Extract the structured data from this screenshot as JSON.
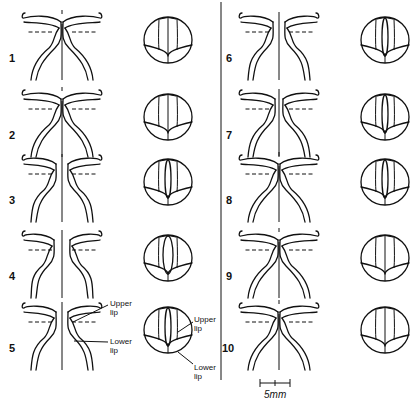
{
  "figure": {
    "panels": [
      {
        "number": "1",
        "column": "left",
        "stage": "closed",
        "eye_lens": "narrow-open"
      },
      {
        "number": "2",
        "column": "left",
        "stage": "closed",
        "eye_lens": "narrow-open"
      },
      {
        "number": "3",
        "column": "left",
        "stage": "open",
        "eye_lens": "slit"
      },
      {
        "number": "4",
        "column": "left",
        "stage": "wide-open",
        "eye_lens": "oval"
      },
      {
        "number": "5",
        "column": "left",
        "stage": "open",
        "eye_lens": "slit-dark"
      },
      {
        "number": "6",
        "column": "right",
        "stage": "open",
        "eye_lens": "slit"
      },
      {
        "number": "7",
        "column": "right",
        "stage": "partially-open",
        "eye_lens": "slit"
      },
      {
        "number": "8",
        "column": "right",
        "stage": "nearly-closed",
        "eye_lens": "slit"
      },
      {
        "number": "9",
        "column": "right",
        "stage": "closed",
        "eye_lens": "narrow-open"
      },
      {
        "number": "10",
        "column": "right",
        "stage": "closed",
        "eye_lens": "narrow-open"
      }
    ],
    "annotations": {
      "upper_lip": "Upper\nlip",
      "lower_lip": "Lower\nlip",
      "upper_line1": "Upper",
      "upper_line2": "lip",
      "lower_line1": "Lower",
      "lower_line2": "lip"
    },
    "scale_bar": {
      "label": "5mm"
    }
  }
}
